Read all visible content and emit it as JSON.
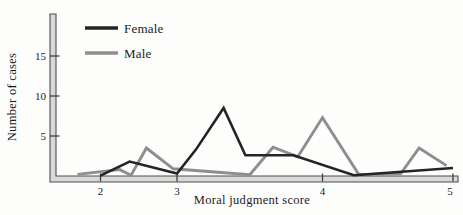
{
  "chart_data": {
    "type": "line",
    "title": "",
    "xlabel": "Moral judgment score",
    "ylabel": "Number of cases",
    "x_axis": {
      "ticks": [
        2,
        3,
        4,
        5
      ],
      "range": [
        1.6,
        5.05
      ]
    },
    "y_axis": {
      "ticks": [
        5,
        10,
        15
      ],
      "range": [
        0,
        20
      ]
    },
    "grid": "off",
    "legend": {
      "position": "top-left",
      "items": [
        {
          "label": "Female"
        },
        {
          "label": "Male"
        }
      ]
    },
    "series": [
      {
        "name": "Female",
        "color": "#242424",
        "stroke_width": 2.6,
        "points": [
          [
            2.0,
            0.05
          ],
          [
            2.38,
            1.8
          ],
          [
            3.0,
            0.3
          ],
          [
            3.13,
            3.3
          ],
          [
            3.32,
            8.5
          ],
          [
            3.47,
            2.6
          ],
          [
            3.8,
            2.6
          ],
          [
            4.24,
            0.1
          ],
          [
            5.0,
            1.0
          ]
        ]
      },
      {
        "name": "Male",
        "color": "#8e8e8e",
        "stroke_width": 2.9,
        "points": [
          [
            1.7,
            0.2
          ],
          [
            2.25,
            0.8
          ],
          [
            2.4,
            0.1
          ],
          [
            2.6,
            3.5
          ],
          [
            2.95,
            0.9
          ],
          [
            3.5,
            0.15
          ],
          [
            3.66,
            3.6
          ],
          [
            3.83,
            2.4
          ],
          [
            4.0,
            7.3
          ],
          [
            4.28,
            0.15
          ],
          [
            4.6,
            0.3
          ],
          [
            4.74,
            3.5
          ],
          [
            4.95,
            1.3
          ]
        ]
      }
    ]
  }
}
